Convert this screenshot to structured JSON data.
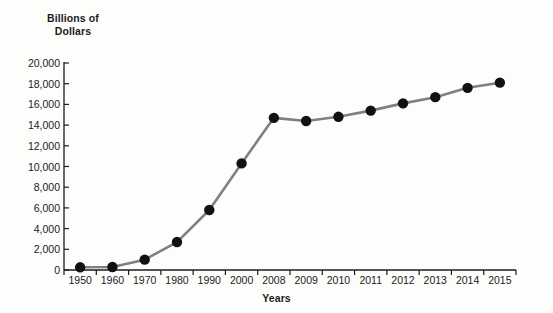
{
  "chart_data": {
    "type": "line",
    "title": "",
    "ylabel": "Billions of\nDollars",
    "xlabel": "Years",
    "categories": [
      "1950",
      "1960",
      "1970",
      "1980",
      "1990",
      "2000",
      "2008",
      "2009",
      "2010",
      "2011",
      "2012",
      "2013",
      "2014",
      "2015"
    ],
    "values": [
      260,
      290,
      1000,
      2700,
      5800,
      10300,
      14700,
      14400,
      14800,
      15400,
      16100,
      16700,
      17600,
      18100
    ],
    "ylim": [
      0,
      20000
    ],
    "yticks": [
      0,
      2000,
      4000,
      6000,
      8000,
      10000,
      12000,
      14000,
      16000,
      18000,
      20000
    ],
    "ytick_labels": [
      "0",
      "2,000",
      "4,000",
      "6,000",
      "8,000",
      "10,000",
      "12,000",
      "14,000",
      "16,000",
      "18,000",
      "20,000"
    ],
    "grid": false,
    "legend": "none",
    "series_name": "Total Debt",
    "marker": "circle",
    "marker_color": "#111111",
    "line_color": "#808080"
  },
  "colors": {
    "background": "#fdfdfc",
    "axis": "#1b1b1b",
    "text": "#1b1b1b",
    "line": "#808080",
    "marker": "#111111"
  }
}
